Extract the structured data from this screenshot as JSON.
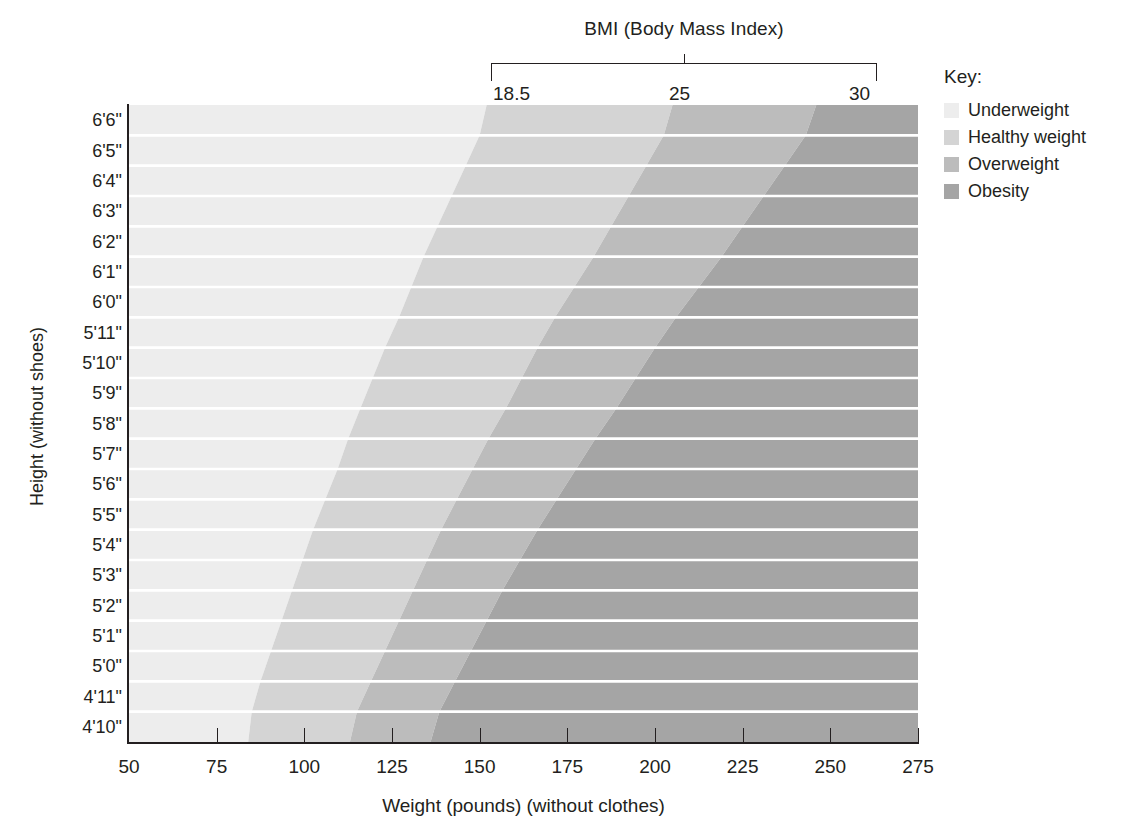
{
  "chart_data": {
    "type": "heatmap",
    "title": "BMI (Body Mass Index)",
    "xlabel": "Weight (pounds) (without clothes)",
    "ylabel": "Height (without shoes)",
    "xlim": [
      50,
      275
    ],
    "ylim_rows": 21,
    "grid": true,
    "legend_position": "right",
    "x_ticks": [
      50,
      75,
      100,
      125,
      150,
      175,
      200,
      225,
      250,
      275
    ],
    "x_tick_labels": [
      "50",
      "75",
      "100",
      "125",
      "150",
      "175",
      "200",
      "225",
      "250",
      "275"
    ],
    "y_tick_labels": [
      "6'6\"",
      "6'5\"",
      "6'4\"",
      "6'3\"",
      "6'2\"",
      "6'1\"",
      "6'0\"",
      "5'11\"",
      "5'10\"",
      "5'9\"",
      "5'8\"",
      "5'7\"",
      "5'6\"",
      "5'5\"",
      "5'4\"",
      "5'3\"",
      "5'2\"",
      "5'1\"",
      "5'0\"",
      "4'11\"",
      "4'10\""
    ],
    "bmi_bracket": {
      "label": "BMI (Body Mass Index)",
      "ticks": [
        "18.5",
        "25",
        "30"
      ],
      "tick_values": [
        18.5,
        25,
        30
      ]
    },
    "categories": [
      {
        "name": "Underweight",
        "bmi_max": 18.5,
        "color": "#ededed"
      },
      {
        "name": "Healthy weight",
        "bmi_min": 18.5,
        "bmi_max": 25,
        "color": "#d4d4d4"
      },
      {
        "name": "Overweight",
        "bmi_min": 25,
        "bmi_max": 30,
        "color": "#bcbcbc"
      },
      {
        "name": "Obesity",
        "bmi_min": 30,
        "color": "#a5a5a5"
      }
    ],
    "boundary_weights_lbs": {
      "note": "Weight in pounds at each BMI boundary for each height row, top (6'6\") to bottom (4'10\")",
      "heights_inches": [
        78,
        77,
        76,
        75,
        74,
        73,
        72,
        71,
        70,
        69,
        68,
        67,
        66,
        65,
        64,
        63,
        62,
        61,
        60,
        59,
        58
      ],
      "bmi_18_5": [
        152,
        148,
        144,
        140,
        136,
        132,
        129,
        125,
        121,
        118,
        114,
        111,
        108,
        104,
        101,
        98,
        95,
        92,
        89,
        86,
        84
      ],
      "bmi_25": [
        205,
        200,
        195,
        190,
        185,
        180,
        174,
        169,
        164,
        160,
        155,
        150,
        146,
        141,
        137,
        133,
        129,
        125,
        121,
        117,
        113
      ],
      "bmi_30": [
        246,
        240,
        234,
        228,
        222,
        216,
        209,
        203,
        197,
        192,
        186,
        180,
        175,
        169,
        164,
        159,
        154,
        150,
        145,
        141,
        136
      ]
    }
  },
  "legend": {
    "title": "Key:",
    "items": [
      {
        "label": "Underweight",
        "color": "#ededed"
      },
      {
        "label": "Healthy weight",
        "color": "#d4d4d4"
      },
      {
        "label": "Overweight",
        "color": "#bcbcbc"
      },
      {
        "label": "Obesity",
        "color": "#a5a5a5"
      }
    ]
  }
}
